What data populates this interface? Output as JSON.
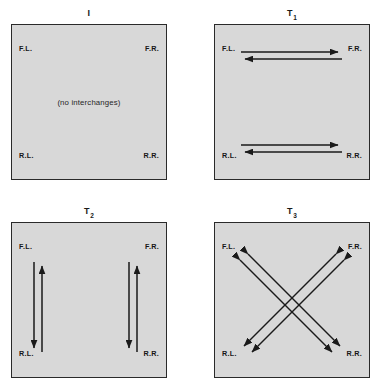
{
  "figure": {
    "colors": {
      "panel_fill": "#d8d8d8",
      "panel_border": "#2a2a2a",
      "arrow": "#1a1a1a",
      "background": "#ffffff",
      "text": "#161616"
    },
    "corner_labels": {
      "front_left": "F.L.",
      "front_right": "F.R.",
      "rear_left": "R.L.",
      "rear_right": "R.R."
    },
    "panels": [
      {
        "id": "panel-identity",
        "title_main": "I",
        "title_sub": "",
        "note": "(no interchanges)",
        "arrows": "none",
        "corners": {
          "front_left": "F.L.",
          "front_right": "F.R.",
          "rear_left": "R.L.",
          "rear_right": "R.R."
        }
      },
      {
        "id": "panel-t1",
        "title_main": "T",
        "title_sub": "1",
        "note": "",
        "arrows": "horizontal-swaps",
        "corners": {
          "front_left": "F.L.",
          "front_right": "F.R.",
          "rear_left": "R.L.",
          "rear_right": "R.R."
        }
      },
      {
        "id": "panel-t2",
        "title_main": "T",
        "title_sub": "2",
        "note": "",
        "arrows": "vertical-swaps",
        "corners": {
          "front_left": "F.L.",
          "front_right": "F.R.",
          "rear_left": "R.L.",
          "rear_right": "R.R."
        }
      },
      {
        "id": "panel-t3",
        "title_main": "T",
        "title_sub": "3",
        "note": "",
        "arrows": "diagonal-swaps",
        "corners": {
          "front_left": "F.L.",
          "front_right": "F.R.",
          "rear_left": "R.L.",
          "rear_right": "R.R."
        }
      }
    ]
  }
}
